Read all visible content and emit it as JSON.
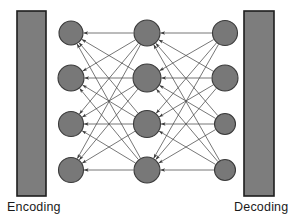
{
  "figure": {
    "width": 294,
    "height": 223,
    "background": "#ffffff"
  },
  "labels": {
    "left": "Encoding",
    "right": "Decoding"
  },
  "colors": {
    "bar_fill": "#7d7d7d",
    "bar_stroke": "#1d1d1d",
    "node_fill": "#787878",
    "node_stroke": "#3a3a3a",
    "edge": "#4a4a4a",
    "text": "#1a1a1a",
    "background": "#ffffff"
  },
  "bars": [
    {
      "name": "encoding-bar",
      "x": 17,
      "y": 11,
      "width": 29,
      "height": 185
    },
    {
      "name": "decoding-bar",
      "x": 244,
      "y": 11,
      "width": 30,
      "height": 185
    }
  ],
  "layers": [
    {
      "name": "input-layer",
      "x": 71,
      "nodes": [
        {
          "cy": 33,
          "r": 12
        },
        {
          "cy": 78,
          "r": 13
        },
        {
          "cy": 124,
          "r": 12.5
        },
        {
          "cy": 170,
          "r": 12.5
        }
      ]
    },
    {
      "name": "hidden-layer",
      "x": 147,
      "nodes": [
        {
          "cy": 33,
          "r": 13
        },
        {
          "cy": 78,
          "r": 14
        },
        {
          "cy": 124,
          "r": 13.5
        },
        {
          "cy": 170,
          "r": 13
        }
      ]
    },
    {
      "name": "output-layer",
      "x": 225,
      "nodes": [
        {
          "cy": 33,
          "r": 12.5
        },
        {
          "cy": 78,
          "r": 13
        },
        {
          "cy": 124,
          "r": 10.5
        },
        {
          "cy": 170,
          "r": 10.5
        }
      ]
    }
  ],
  "edges": {
    "encoding_block": {
      "from_layer": 0,
      "to_layer": 1,
      "fully_connected": true,
      "arrow_direction": "toward-input-layer",
      "count": 16
    },
    "decoding_block": {
      "from_layer": 1,
      "to_layer": 2,
      "fully_connected": true,
      "arrow_direction": "toward-hidden-layer",
      "count": 16
    }
  },
  "caption_positions": {
    "left_x": 7,
    "left_y": 211,
    "right_x": 234,
    "right_y": 211
  }
}
